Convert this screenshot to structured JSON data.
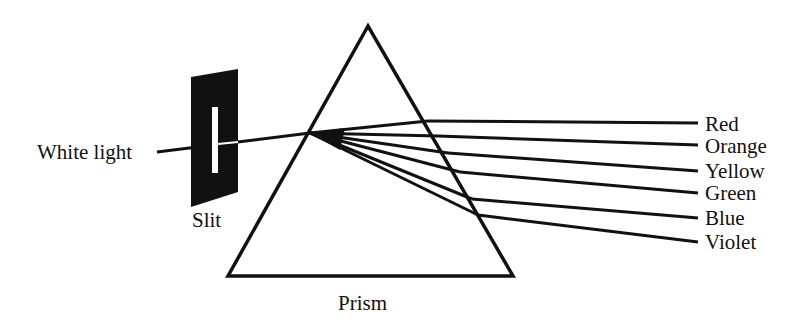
{
  "diagram": {
    "labels": {
      "source": "White light",
      "slit": "Slit",
      "prism": "Prism"
    },
    "spectrum": [
      {
        "name": "Red"
      },
      {
        "name": "Orange"
      },
      {
        "name": "Yellow"
      },
      {
        "name": "Green"
      },
      {
        "name": "Blue"
      },
      {
        "name": "Violet"
      }
    ],
    "colors": {
      "ink": "#111111",
      "background": "#ffffff"
    }
  }
}
